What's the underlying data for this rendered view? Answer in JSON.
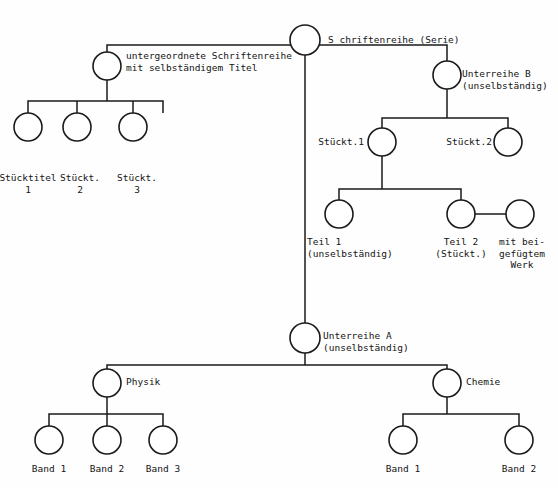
{
  "diagram": {
    "type": "tree-diagram",
    "canvas": {
      "width": 558,
      "height": 488
    },
    "colors": {
      "stroke": "#1a1a1a",
      "fill": "#ffffff",
      "text": "#141414",
      "background": "#fefefe"
    },
    "nodes": [
      {
        "id": "root",
        "cx": 305,
        "cy": 40,
        "r": 15
      },
      {
        "id": "sub-series",
        "cx": 107,
        "cy": 66,
        "r": 14
      },
      {
        "id": "unterreihe-b",
        "cx": 447,
        "cy": 75,
        "r": 14
      },
      {
        "id": "stueckt1",
        "cx": 28,
        "cy": 127,
        "r": 14
      },
      {
        "id": "stueckt2",
        "cx": 77,
        "cy": 127,
        "r": 14
      },
      {
        "id": "stueckt3",
        "cx": 133,
        "cy": 127,
        "r": 14
      },
      {
        "id": "st1-node",
        "cx": 382,
        "cy": 142,
        "r": 14
      },
      {
        "id": "st2-node",
        "cx": 508,
        "cy": 142,
        "r": 14
      },
      {
        "id": "teil1",
        "cx": 339,
        "cy": 214,
        "r": 14
      },
      {
        "id": "teil2",
        "cx": 461,
        "cy": 214,
        "r": 14
      },
      {
        "id": "beigefuegt",
        "cx": 520,
        "cy": 214,
        "r": 14
      },
      {
        "id": "unterreihe-a",
        "cx": 305,
        "cy": 338,
        "r": 15
      },
      {
        "id": "physik",
        "cx": 107,
        "cy": 383,
        "r": 14
      },
      {
        "id": "chemie",
        "cx": 447,
        "cy": 383,
        "r": 14
      },
      {
        "id": "physik-b1",
        "cx": 49,
        "cy": 440,
        "r": 14
      },
      {
        "id": "physik-b2",
        "cx": 107,
        "cy": 440,
        "r": 14
      },
      {
        "id": "physik-b3",
        "cx": 163,
        "cy": 440,
        "r": 14
      },
      {
        "id": "chemie-b1",
        "cx": 403,
        "cy": 440,
        "r": 14
      },
      {
        "id": "chemie-b2",
        "cx": 519,
        "cy": 440,
        "r": 14
      }
    ],
    "labels": [
      {
        "id": "root-label",
        "text": "S chriftenreihe (Serie)",
        "x": 328,
        "y": 34,
        "align": "left"
      },
      {
        "id": "sub-series-label",
        "text": "untergeordnete Schriftenreihe\nmit selbständigem Titel",
        "x": 126,
        "y": 50,
        "align": "left"
      },
      {
        "id": "unterreihe-b-label",
        "text": "Unterreihe B\n(unselbständig)",
        "x": 462,
        "y": 68,
        "align": "left"
      },
      {
        "id": "stueckt1-label",
        "text": "Stücktitel\n1",
        "x": 28,
        "y": 172,
        "align": "center"
      },
      {
        "id": "stueckt2-label",
        "text": "Stückt.\n2",
        "x": 80,
        "y": 172,
        "align": "center"
      },
      {
        "id": "stueckt3-label",
        "text": "Stückt.\n3",
        "x": 137,
        "y": 172,
        "align": "center"
      },
      {
        "id": "st1-label",
        "text": "Stückt.1",
        "x": 364,
        "y": 136,
        "align": "right"
      },
      {
        "id": "st2-label",
        "text": "Stückt.2",
        "x": 492,
        "y": 136,
        "align": "right"
      },
      {
        "id": "teil1-label",
        "text": "Teil 1\n(unselbständig)",
        "x": 307,
        "y": 236,
        "align": "left"
      },
      {
        "id": "teil2-label",
        "text": "Teil 2\n(Stückt.)",
        "x": 461,
        "y": 236,
        "align": "center"
      },
      {
        "id": "beigefuegt-label",
        "text": "mit bei-\ngefügtem\nWerk",
        "x": 522,
        "y": 236,
        "align": "center"
      },
      {
        "id": "unterreihe-a-label",
        "text": "Unterreihe A\n(unselbständig)",
        "x": 323,
        "y": 330,
        "align": "left"
      },
      {
        "id": "physik-label",
        "text": "Physik",
        "x": 126,
        "y": 376,
        "align": "left"
      },
      {
        "id": "chemie-label",
        "text": "Chemie",
        "x": 466,
        "y": 376,
        "align": "left"
      },
      {
        "id": "physik-b1-label",
        "text": "Band 1",
        "x": 49,
        "y": 463,
        "align": "center"
      },
      {
        "id": "physik-b2-label",
        "text": "Band 2",
        "x": 107,
        "y": 463,
        "align": "center"
      },
      {
        "id": "physik-b3-label",
        "text": "Band 3",
        "x": 163,
        "y": 463,
        "align": "center"
      },
      {
        "id": "chemie-b1-label",
        "text": "Band 1",
        "x": 403,
        "y": 463,
        "align": "center"
      },
      {
        "id": "chemie-b2-label",
        "text": "Band 2",
        "x": 519,
        "y": 463,
        "align": "center"
      }
    ],
    "edges": [
      {
        "id": "root-trunk",
        "d": "M 305 55 L 305 323"
      },
      {
        "id": "root-to-level1-bus",
        "d": "M 107 52 L 107 45 L 447 45 L 447 61"
      },
      {
        "id": "subseries-down",
        "d": "M 107 80 L 107 101"
      },
      {
        "id": "subseries-bus",
        "d": "M 28 113 L 28 101 L 163 101 L 163 113"
      },
      {
        "id": "subseries-bus-mid",
        "d": "M 77 113 L 77 101"
      },
      {
        "id": "subseries-bus-3",
        "d": "M 133 113 L 133 101"
      },
      {
        "id": "unterreihe-b-down",
        "d": "M 447 89 L 447 118"
      },
      {
        "id": "unterreihe-b-bus",
        "d": "M 382 128 L 382 118 L 508 118 L 508 128"
      },
      {
        "id": "st1-down",
        "d": "M 382 156 L 382 189"
      },
      {
        "id": "st1-bus",
        "d": "M 339 200 L 339 189 L 461 189 L 461 200"
      },
      {
        "id": "teil2-to-beigefuegt",
        "d": "M 475 214 L 506 214"
      },
      {
        "id": "unterreihe-a-down",
        "d": "M 305 353 L 305 365"
      },
      {
        "id": "unterreihe-a-bus",
        "d": "M 107 369 L 107 365 L 447 365 L 447 369"
      },
      {
        "id": "physik-down",
        "d": "M 107 397 L 107 414"
      },
      {
        "id": "physik-bus",
        "d": "M 49 426 L 49 414 L 163 414 L 163 426"
      },
      {
        "id": "physik-bus-mid",
        "d": "M 107 426 L 107 414"
      },
      {
        "id": "chemie-down",
        "d": "M 447 397 L 447 414"
      },
      {
        "id": "chemie-bus",
        "d": "M 403 426 L 403 414 L 519 414 L 519 426"
      }
    ]
  }
}
